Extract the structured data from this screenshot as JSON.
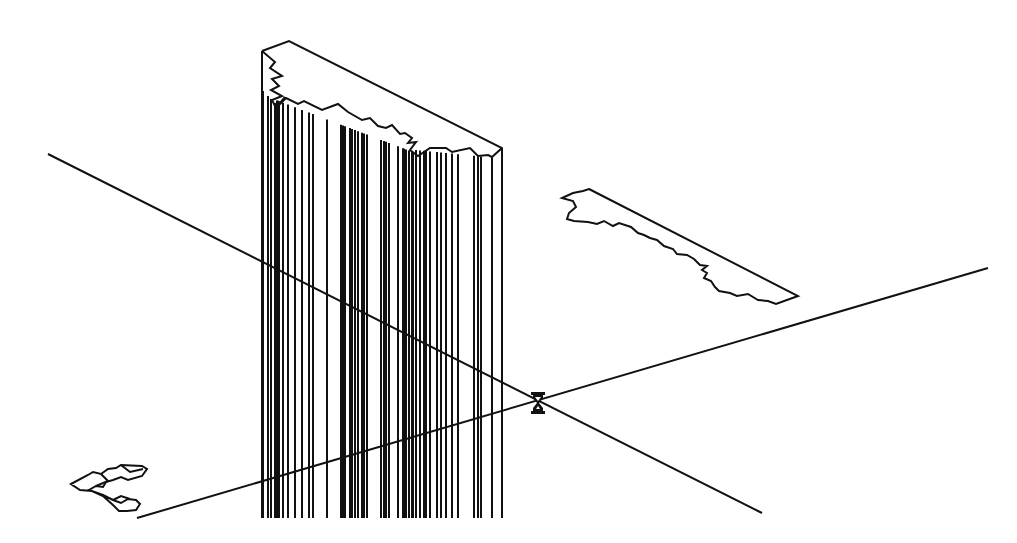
{
  "viewport": {
    "background": "#ffffff",
    "stroke_color": "#111111",
    "description": "Wireframe 3D CAD model view"
  },
  "axes": [
    {
      "name": "axis-line-1",
      "x1": 48,
      "y1": 154,
      "x2": 762,
      "y2": 513
    },
    {
      "name": "axis-line-2",
      "x1": 137,
      "y1": 518,
      "x2": 988,
      "y2": 268
    }
  ],
  "column": {
    "left_x": 262,
    "right_x": 502,
    "bottom_y": 518,
    "vertical_lines_x": [
      263,
      268,
      271,
      275,
      277,
      278,
      279,
      283,
      288,
      295,
      302,
      309,
      313,
      327,
      341,
      343,
      345,
      350,
      352,
      355,
      358,
      362,
      364,
      367,
      381,
      384,
      386,
      389,
      398,
      403,
      404,
      406,
      409,
      412,
      413,
      416,
      420,
      424,
      426,
      430,
      437,
      441,
      446,
      452,
      458,
      474,
      478,
      481
    ]
  },
  "cursor": {
    "type": "hourglass-busy",
    "x": 531,
    "y": 392
  }
}
